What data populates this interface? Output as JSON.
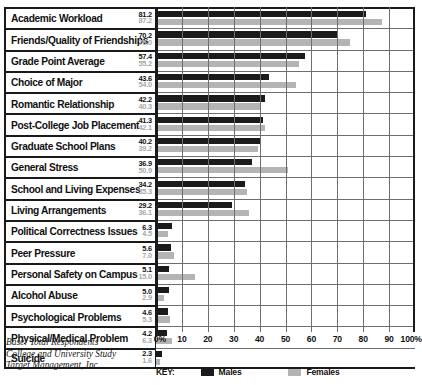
{
  "chart_data": {
    "type": "bar",
    "orientation": "horizontal",
    "title": "",
    "xlabel": "",
    "ylabel": "",
    "xlim": [
      0,
      100
    ],
    "xticks": [
      "0%",
      "10",
      "20",
      "30",
      "40",
      "50",
      "60",
      "70",
      "80",
      "90",
      "100%"
    ],
    "xtick_values": [
      0,
      10,
      20,
      30,
      40,
      50,
      60,
      70,
      80,
      90,
      100
    ],
    "grid": true,
    "legend_position": "bottom",
    "categories": [
      "Academic Workload",
      "Friends/Quality of Friendships",
      "Grade Point Average",
      "Choice of Major",
      "Romantic Relationship",
      "Post-College Job Placement",
      "Graduate School Plans",
      "General Stress",
      "School and Living Expenses",
      "Living Arrangements",
      "Political Correctness Issues",
      "Peer Pressure",
      "Personal Safety on Campus",
      "Alcohol Abuse",
      "Psychological Problems",
      "Physical/Medical Problem",
      "Suicide"
    ],
    "series": [
      {
        "name": "Males",
        "color": "#1b1b1b",
        "values": [
          81.2,
          70.2,
          57.4,
          43.6,
          42.2,
          41.3,
          40.2,
          36.9,
          34.2,
          29.2,
          6.3,
          5.6,
          5.1,
          5.0,
          4.6,
          4.2,
          2.3
        ]
      },
      {
        "name": "Females",
        "color": "#b4b4b4",
        "values": [
          87.2,
          75.0,
          55.2,
          54.0,
          40.3,
          42.1,
          39.2,
          50.9,
          35.3,
          36.1,
          4.5,
          7.0,
          15.0,
          2.9,
          5.3,
          6.3,
          1.6
        ]
      }
    ]
  },
  "key": {
    "label": "KEY:",
    "males": "Males",
    "females": "Females"
  },
  "source": {
    "line1": "Base: Total Respondents",
    "line2": "College and University Study",
    "line3": "Target Management, Inc."
  }
}
